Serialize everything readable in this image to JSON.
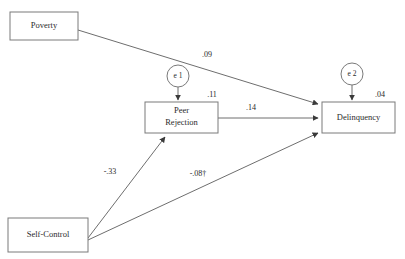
{
  "diagram": {
    "type": "path-diagram",
    "background_color": "#ffffff",
    "line_color": "#6e6e6e",
    "box_stroke_color": "#7a7a7a",
    "text_color": "#2b2b2b",
    "nodes": [
      {
        "id": "poverty",
        "label": "Poverty",
        "shape": "rectangle",
        "x": 10,
        "y": 12,
        "w": 68,
        "h": 28
      },
      {
        "id": "peer_rejection",
        "label_line1": "Peer",
        "label_line2": "Rejection",
        "label": "Peer Rejection",
        "shape": "rectangle",
        "x": 145,
        "y": 102,
        "w": 73,
        "h": 31
      },
      {
        "id": "delinquency",
        "label": "Delinquency",
        "shape": "rectangle",
        "x": 322,
        "y": 102,
        "w": 73,
        "h": 31
      },
      {
        "id": "self_control",
        "label": "Self-Control",
        "shape": "rectangle",
        "x": 8,
        "y": 218,
        "w": 80,
        "h": 34
      }
    ],
    "errors": [
      {
        "id": "e1",
        "label": "e 1",
        "shape": "circle",
        "cx": 178,
        "cy": 76,
        "r": 11,
        "target": "peer_rejection"
      },
      {
        "id": "e2",
        "label": "e 2",
        "shape": "circle",
        "cx": 352,
        "cy": 74,
        "r": 11,
        "target": "delinquency"
      }
    ],
    "paths": [
      {
        "id": "poverty-to-delinquency",
        "from": "poverty",
        "to": "delinquency",
        "coefficient": ".09",
        "label_x": 207,
        "label_y": 55
      },
      {
        "id": "e1-to-peer-rejection",
        "from": "e1",
        "to": "peer_rejection",
        "coefficient": ".11",
        "label_x": 212,
        "label_y": 95
      },
      {
        "id": "peer-rejection-to-delinquency",
        "from": "peer_rejection",
        "to": "delinquency",
        "coefficient": ".14",
        "label_x": 251,
        "label_y": 108
      },
      {
        "id": "e2-to-delinquency",
        "from": "e2",
        "to": "delinquency",
        "coefficient": ".04",
        "label_x": 380,
        "label_y": 95
      },
      {
        "id": "self-control-to-peer-rejection",
        "from": "self_control",
        "to": "peer_rejection",
        "coefficient": "-.33",
        "label_x": 110,
        "label_y": 172
      },
      {
        "id": "self-control-to-delinquency",
        "from": "self_control",
        "to": "delinquency",
        "coefficient": "-.08†",
        "label_x": 198,
        "label_y": 174
      }
    ]
  }
}
